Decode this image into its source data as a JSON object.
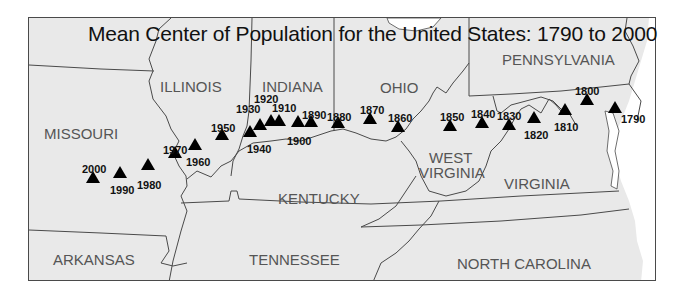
{
  "title": "Mean Center of Population for the United States: 1790 to 2000",
  "colors": {
    "land": "#e9e9e9",
    "water": "#ffffff",
    "border": "#4a4a4a",
    "label": "#555555",
    "marker": "#000000"
  },
  "states": [
    {
      "name": "MISSOURI",
      "x": 44,
      "y": 126
    },
    {
      "name": "ILLINOIS",
      "x": 160,
      "y": 79
    },
    {
      "name": "INDIANA",
      "x": 262,
      "y": 79
    },
    {
      "name": "OHIO",
      "x": 380,
      "y": 80
    },
    {
      "name": "PENNSYLVANIA",
      "x": 502,
      "y": 52
    },
    {
      "name": "KENTUCKY",
      "x": 278,
      "y": 191
    },
    {
      "name": "WEST",
      "x": 429,
      "y": 150
    },
    {
      "name": "VIRGINIA_WV",
      "display": "VIRGINIA",
      "x": 419,
      "y": 165
    },
    {
      "name": "VIRGINIA",
      "x": 504,
      "y": 176
    },
    {
      "name": "ARKANSAS",
      "x": 53,
      "y": 252
    },
    {
      "name": "TENNESSEE",
      "x": 249,
      "y": 252
    },
    {
      "name": "NORTH CAROLINA",
      "x": 457,
      "y": 256
    }
  ],
  "markers": [
    {
      "year": "1790",
      "x": 615,
      "y": 107,
      "label_x": 621,
      "label_y": 114
    },
    {
      "year": "1800",
      "x": 587,
      "y": 99,
      "label_x": 575,
      "label_y": 86
    },
    {
      "year": "1810",
      "x": 565,
      "y": 109,
      "label_x": 554,
      "label_y": 122
    },
    {
      "year": "1820",
      "x": 534,
      "y": 117,
      "label_x": 524,
      "label_y": 130
    },
    {
      "year": "1830",
      "x": 509,
      "y": 124,
      "label_x": 497,
      "label_y": 111
    },
    {
      "year": "1840",
      "x": 482,
      "y": 122,
      "label_x": 471,
      "label_y": 109
    },
    {
      "year": "1850",
      "x": 450,
      "y": 125,
      "label_x": 440,
      "label_y": 112
    },
    {
      "year": "1860",
      "x": 398,
      "y": 126,
      "label_x": 388,
      "label_y": 113
    },
    {
      "year": "1870",
      "x": 370,
      "y": 118,
      "label_x": 360,
      "label_y": 105
    },
    {
      "year": "1880",
      "x": 338,
      "y": 122,
      "label_x": 327,
      "label_y": 112
    },
    {
      "year": "1890",
      "x": 311,
      "y": 121,
      "label_x": 302,
      "label_y": 110
    },
    {
      "year": "1900",
      "x": 298,
      "y": 121,
      "label_x": 287,
      "label_y": 136
    },
    {
      "year": "1910",
      "x": 279,
      "y": 120,
      "label_x": 272,
      "label_y": 103
    },
    {
      "year": "1920",
      "x": 271,
      "y": 120,
      "label_x": 254,
      "label_y": 94
    },
    {
      "year": "1930",
      "x": 260,
      "y": 124,
      "label_x": 236,
      "label_y": 104
    },
    {
      "year": "1940",
      "x": 250,
      "y": 131,
      "label_x": 247,
      "label_y": 144
    },
    {
      "year": "1950",
      "x": 222,
      "y": 134,
      "label_x": 211,
      "label_y": 123
    },
    {
      "year": "1960",
      "x": 195,
      "y": 144,
      "label_x": 186,
      "label_y": 157
    },
    {
      "year": "1970",
      "x": 175,
      "y": 152,
      "label_x": 163,
      "label_y": 145
    },
    {
      "year": "1980",
      "x": 148,
      "y": 164,
      "label_x": 137,
      "label_y": 180
    },
    {
      "year": "1990",
      "x": 120,
      "y": 172,
      "label_x": 110,
      "label_y": 185
    },
    {
      "year": "2000",
      "x": 93,
      "y": 177,
      "label_x": 82,
      "label_y": 164
    }
  ]
}
